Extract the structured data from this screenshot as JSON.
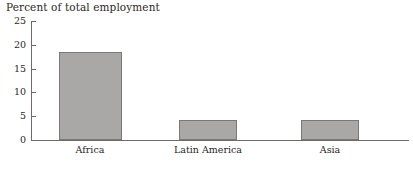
{
  "chart_data": {
    "type": "bar",
    "title": "Percent of total employment",
    "xlabel": "",
    "ylabel": "",
    "categories": [
      "Africa",
      "Latin America",
      "Asia"
    ],
    "values": [
      18.5,
      4.2,
      4.2
    ],
    "ylim": [
      0,
      25
    ],
    "yticks": [
      0,
      5,
      10,
      15,
      20,
      25
    ],
    "ytick_labels": [
      "0",
      "5",
      "10",
      "15",
      "20",
      "25"
    ],
    "grid": false,
    "legend": "none",
    "bar_color": "#a9a8a6",
    "bar_edge_color": "#7b7977",
    "axis_color": "#6f6a66",
    "text_color": "#2b2724",
    "background": "#ffffff"
  }
}
